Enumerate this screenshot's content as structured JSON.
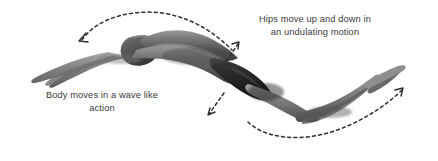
{
  "figure": {
    "name": "swimming-butterfly-stroke-body-undulation-diagram",
    "background_color": "#ffffff",
    "width": 438,
    "height": 161
  },
  "subject": {
    "name": "swimmer-underwater-butterfly-undulation",
    "description": "Greyscale photograph of a swimmer in a dark swimsuit viewed from the side, arms extended forward to the left, head down, back arched upward and hips dipping, legs and feet angled up to the right",
    "tone_dark": "#3d3d3d",
    "tone_mid": "#7a7a7a",
    "tone_light": "#c9c9c9"
  },
  "captions": [
    {
      "id": "caption-hips",
      "text": "Hips move up and down in\nan undulating motion",
      "color": "#3b3b3b"
    },
    {
      "id": "caption-body",
      "text": "Body moves in a wave like\naction",
      "color": "#3b3b3b"
    }
  ],
  "annotations": {
    "arc_top": {
      "name": "dashed-arc-upper-body-wave",
      "description": "Dashed arc over the swimmer's back with an arrowhead pointing down-left toward the shoulders"
    },
    "arc_bottom": {
      "name": "dashed-arc-lower-body-wave",
      "description": "Long dashed arc sweeping beneath the hips and legs with an arrowhead pointing up-right past the feet"
    },
    "arrow_hips_up": {
      "name": "dashed-arrow-hips-up",
      "description": "Short dashed arrow at the hips pointing up and to the right"
    },
    "arrow_hips_down": {
      "name": "dashed-arrow-hips-down",
      "description": "Short dashed arrow below the hips pointing down and to the left"
    },
    "dash_color": "#2e2e2e"
  }
}
